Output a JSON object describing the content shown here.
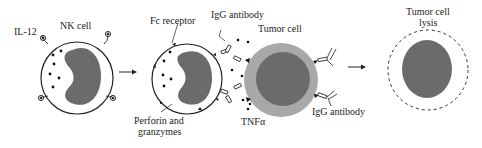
{
  "diagram": {
    "labels": {
      "il12": "IL-12",
      "nk_cell": "NK cell",
      "fc_receptor": "Fc receptor",
      "igg_antibody_top": "IgG antibody",
      "tumor_cell": "Tumor cell",
      "perforin_line1": "Perforin and",
      "perforin_line2": "granzymes",
      "tnfa": "TNFα",
      "igg_antibody_bottom": "IgG antibody",
      "lysis_line1": "Tumor cell",
      "lysis_line2": "lysis"
    },
    "colors": {
      "nucleus": "#6b6b6b",
      "tumor_outer": "#a8a8a8",
      "tumor_inner": "#6b6b6b",
      "outline": "#222222"
    },
    "stages": [
      {
        "id": "nk-cell-activation",
        "description": "NK cell with IL-12 receptors"
      },
      {
        "id": "adcc-synapse",
        "description": "NK cell binds IgG-coated tumor cell via Fc receptor, releasing perforin, granzymes and TNFα"
      },
      {
        "id": "tumor-lysis",
        "description": "Tumor cell lysis"
      }
    ]
  }
}
